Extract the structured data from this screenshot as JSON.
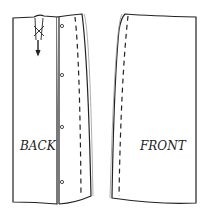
{
  "diagram": {
    "type": "sewing-pattern-technical-drawing",
    "pieces": [
      {
        "name": "back",
        "label": "BACK",
        "buttons": 4,
        "features": [
          "top dart/pleat with tacks",
          "button placket",
          "stitched seam line"
        ]
      },
      {
        "name": "front",
        "label": "FRONT",
        "features": [
          "stitched seam line"
        ]
      }
    ]
  }
}
